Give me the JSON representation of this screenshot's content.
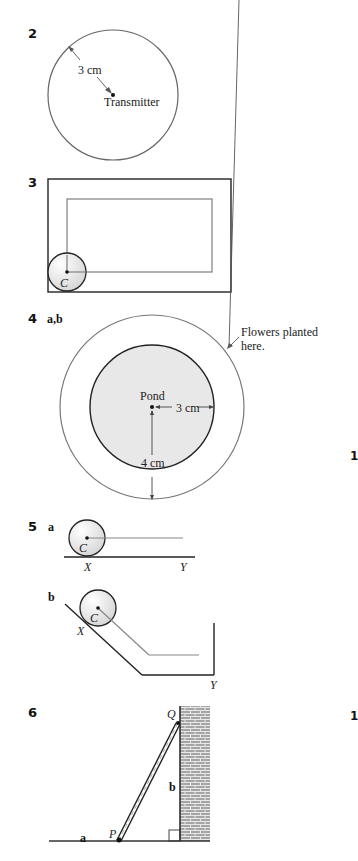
{
  "questions": [
    {
      "number": "2",
      "labels": {
        "radius": "3 cm",
        "center": "Transmitter"
      }
    },
    {
      "number": "3",
      "labels": {
        "center": "C"
      }
    },
    {
      "number": "4",
      "part": "a,b",
      "labels": {
        "center": "Pond",
        "inner_radius": "3 cm",
        "outer_gap": "4 cm",
        "annotation_line1": "Flowers planted",
        "annotation_line2": "here."
      }
    },
    {
      "number": "5",
      "parts": [
        {
          "part": "a",
          "labels": {
            "center": "C",
            "start": "X",
            "end": "Y"
          }
        },
        {
          "part": "b",
          "labels": {
            "center": "C",
            "start": "X",
            "end": "Y"
          }
        }
      ]
    },
    {
      "number": "6",
      "labels": {
        "top": "Q",
        "bottom": "P",
        "side_a": "a",
        "side_b": "b"
      }
    }
  ],
  "edge_fragments": [
    "1",
    "1"
  ],
  "colors": {
    "ink": "#222222",
    "guide_line": "#808080",
    "fill_grey": "#e6e6e6",
    "brick": "#9a9a9a"
  }
}
